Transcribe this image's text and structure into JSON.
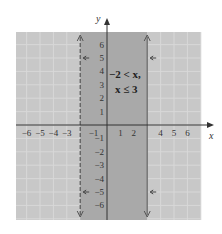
{
  "graph": {
    "axis_labels": {
      "x": "x",
      "y": "y"
    },
    "x_ticks": [
      "−6",
      "−5",
      "−4",
      "−3",
      "−1",
      "1",
      "2",
      "4",
      "5",
      "6"
    ],
    "x_tick_values": [
      -6,
      -5,
      -4,
      -3,
      -1,
      1,
      2,
      4,
      5,
      6
    ],
    "y_ticks": [
      "6",
      "5",
      "4",
      "3",
      "2",
      "1",
      "−1",
      "−2",
      "−3",
      "−4",
      "−5",
      "−6"
    ],
    "y_tick_values": [
      6,
      5,
      4,
      3,
      2,
      1,
      -1,
      -2,
      -3,
      -4,
      -5,
      -6
    ],
    "inequality_line1": "−2 < x,",
    "inequality_line2": "x ≤ 3",
    "left_boundary": {
      "x": -2,
      "style": "dashed"
    },
    "right_boundary": {
      "x": 3,
      "style": "solid"
    },
    "colors": {
      "background_panel": "#c8c8c8",
      "grid": "#dadada",
      "shaded_region": "#a9a9a9",
      "axis": "#333333"
    }
  }
}
